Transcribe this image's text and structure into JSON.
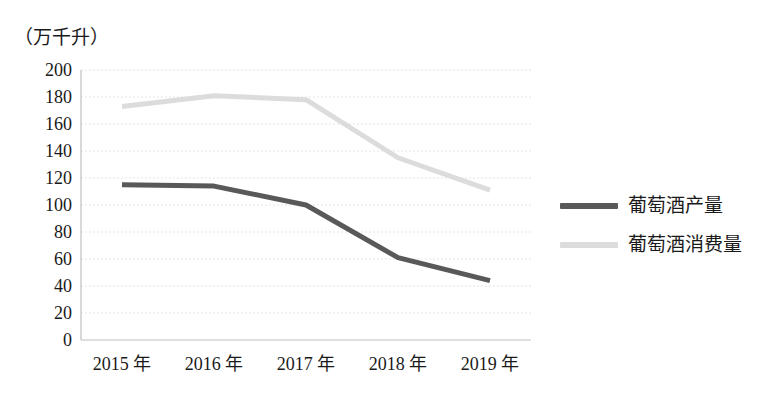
{
  "chart_data": {
    "type": "line",
    "title": "",
    "unit_label": "（万千升）",
    "xlabel": "",
    "ylabel": "",
    "categories": [
      "2015 年",
      "2016 年",
      "2017 年",
      "2018 年",
      "2019 年"
    ],
    "ylim": [
      0,
      200
    ],
    "y_ticks": [
      200,
      180,
      160,
      140,
      120,
      100,
      80,
      60,
      40,
      20,
      0
    ],
    "grid": true,
    "legend_position": "right",
    "series": [
      {
        "name": "葡萄酒产量",
        "color": "#595959",
        "values": [
          115,
          114,
          100,
          61,
          44
        ]
      },
      {
        "name": "葡萄酒消费量",
        "color": "#dcdcdc",
        "values": [
          173,
          181,
          178,
          135,
          111
        ]
      }
    ]
  },
  "legend": {
    "items": [
      {
        "label": "葡萄酒产量",
        "color": "#595959"
      },
      {
        "label": "葡萄酒消费量",
        "color": "#dcdcdc"
      }
    ]
  },
  "axis": {
    "unit": "（万千升）",
    "y_ticks": [
      "200",
      "180",
      "160",
      "140",
      "120",
      "100",
      "80",
      "60",
      "40",
      "20",
      "0"
    ],
    "x_ticks": [
      "2015 年",
      "2016 年",
      "2017 年",
      "2018 年",
      "2019 年"
    ]
  },
  "colors": {
    "background": "#ffffff",
    "text": "#1a1a1a",
    "axis_line": "#bfbfbf",
    "gridline": "#e4e4e4",
    "series_production": "#595959",
    "series_consumption": "#dcdcdc"
  }
}
